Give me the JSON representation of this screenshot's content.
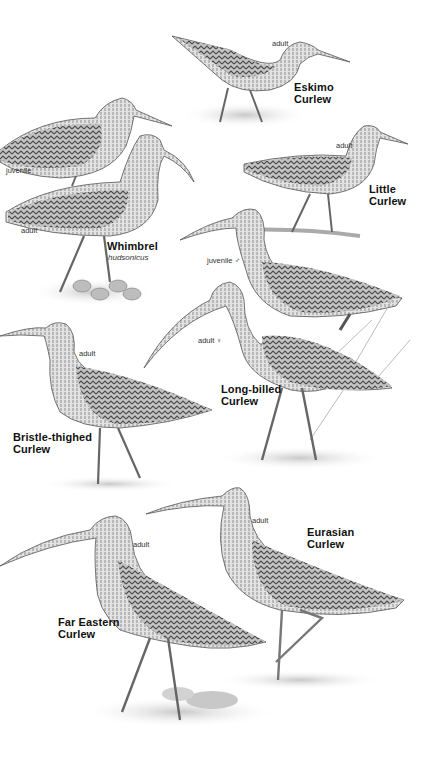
{
  "plate": {
    "description": "Curlew identification plate",
    "species": [
      {
        "id": "eskimo",
        "name": "Eskimo\nCurlew",
        "labels": [
          "adult"
        ]
      },
      {
        "id": "whimbrel",
        "name": "Whimbrel",
        "subspecies": "hudsonicus",
        "labels": [
          "juvenile",
          "adult"
        ]
      },
      {
        "id": "little",
        "name": "Little\nCurlew",
        "labels": [
          "adult"
        ]
      },
      {
        "id": "longbilled",
        "name": "Long-billed\nCurlew",
        "labels": [
          "juvenile ♂",
          "adult ♀"
        ]
      },
      {
        "id": "bristle",
        "name": "Bristle-thighed\nCurlew",
        "labels": [
          "adult"
        ]
      },
      {
        "id": "eurasian",
        "name": "Eurasian\nCurlew",
        "labels": [
          "adult"
        ]
      },
      {
        "id": "fareastern",
        "name": "Far Eastern\nCurlew",
        "labels": [
          "adult"
        ]
      }
    ]
  },
  "colors": {
    "ink": "#111111",
    "body": "#b9b9b9",
    "dark": "#5a5a5a",
    "ground": "#d8d8d8",
    "paper": "#ffffff"
  }
}
